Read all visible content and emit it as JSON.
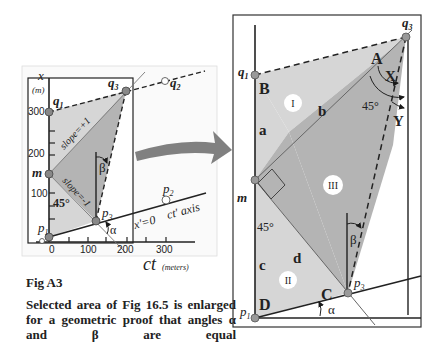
{
  "small_figure": {
    "axis_x_label": "x",
    "axis_x_unit": "(m)",
    "y_ticks": [
      "300",
      "200",
      "100",
      "0"
    ],
    "x_ticks": [
      "0",
      "100",
      "200",
      "300"
    ],
    "ct_label": "ct",
    "ct_unit": "(meters)",
    "point_q1": "q",
    "point_q1_sub": "1",
    "point_q2": "q",
    "point_q2_sub": "2",
    "point_q3": "q",
    "point_q3_sub": "3",
    "point_m": "m",
    "point_p1": "p",
    "point_p1_sub": "1",
    "point_p2": "p",
    "point_p2_sub": "2",
    "point_p3": "p",
    "point_p3_sub": "3",
    "slope_plus": "slope=+1",
    "slope_minus": "slope=-1",
    "angle_45": "45°",
    "angle_alpha": "α",
    "angle_beta": "β",
    "x_prime_label": "x'=0",
    "ct_prime_label": "ct' axis"
  },
  "large_figure": {
    "point_q1": "q",
    "point_q1_sub": "1",
    "point_q3": "q",
    "point_q3_sub": "3",
    "point_m": "m",
    "point_p1": "p",
    "point_p1_sub": "1",
    "point_p3": "p",
    "point_p3_sub": "3",
    "vertex_A": "A",
    "vertex_B": "B",
    "vertex_C": "C",
    "vertex_D": "D",
    "side_a": "a",
    "side_b": "b",
    "side_c": "c",
    "side_d": "d",
    "region_I": "I",
    "region_II": "II",
    "region_III": "III",
    "angle_X": "X",
    "angle_Y": "Y",
    "angle_45_top": "45°",
    "angle_45_mid": "45°",
    "angle_alpha": "α",
    "angle_beta": "β"
  },
  "caption": {
    "title": "Fig  A3",
    "body": "Selected area of Fig 16.5 is enlarged for a geometric proof that angles α and β are equal"
  },
  "colors": {
    "light_fill": "#d6d6d6",
    "dark_fill": "#b4b4b4",
    "line": "#1a1a1a",
    "arrow": "#808080"
  }
}
